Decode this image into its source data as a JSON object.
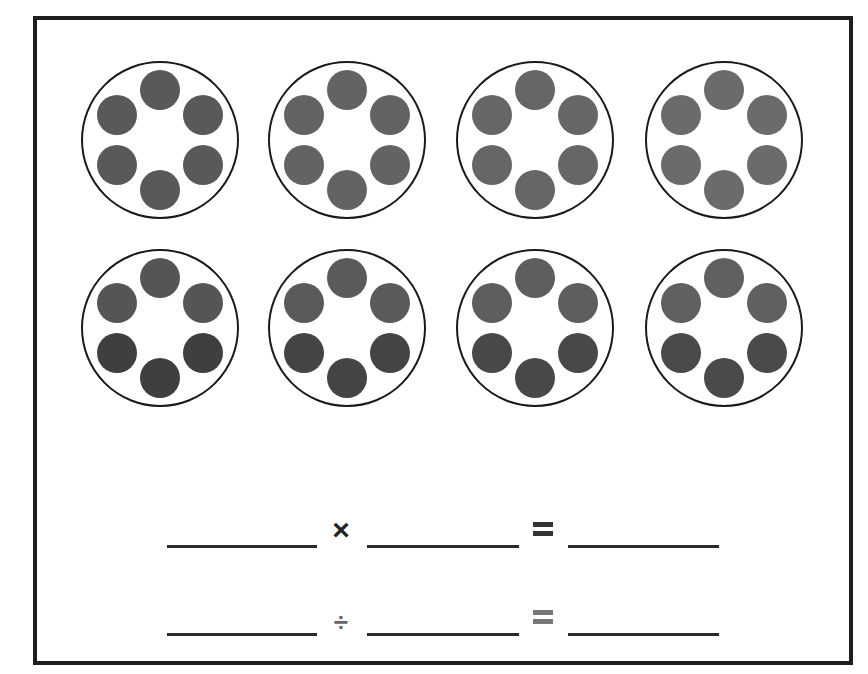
{
  "worksheet": {
    "groups_count": 8,
    "dots_per_group": 6,
    "rows": [
      {
        "groups": [
          {
            "cx": 160,
            "cy": 140,
            "dot_color": "#595959"
          },
          {
            "cx": 347,
            "cy": 140,
            "dot_color": "#636363"
          },
          {
            "cx": 535,
            "cy": 140,
            "dot_color": "#666666"
          },
          {
            "cx": 724,
            "cy": 140,
            "dot_color": "#6b6b6b"
          }
        ]
      },
      {
        "groups": [
          {
            "cx": 160,
            "cy": 328,
            "dot_color": "#555555",
            "dot_color_dark": "#3f3f3f"
          },
          {
            "cx": 347,
            "cy": 328,
            "dot_color": "#5a5a5a",
            "dot_color_dark": "#444444"
          },
          {
            "cx": 535,
            "cy": 328,
            "dot_color": "#5e5e5e",
            "dot_color_dark": "#484848"
          },
          {
            "cx": 724,
            "cy": 328,
            "dot_color": "#606060",
            "dot_color_dark": "#4a4a4a"
          }
        ]
      }
    ],
    "equations": [
      {
        "operator": "×",
        "operator_name": "multiply",
        "equals": "=",
        "y": 545,
        "operator_color": "#222222",
        "equals_color": "#333333"
      },
      {
        "operator": "÷",
        "operator_name": "divide",
        "equals": "=",
        "y": 633,
        "operator_color": "#666666",
        "equals_color": "#777777"
      }
    ],
    "blanks_x": [
      [
        167,
        317
      ],
      [
        367,
        519
      ],
      [
        568,
        719
      ]
    ]
  }
}
